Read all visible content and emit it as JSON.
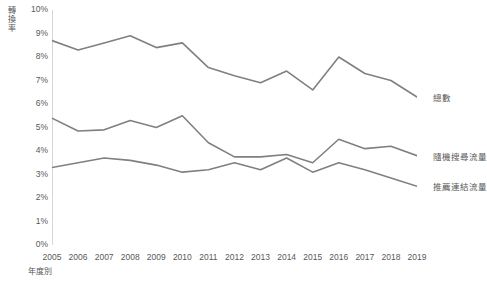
{
  "chart_data": {
    "type": "line",
    "title": "",
    "xlabel": "年度別",
    "ylabel": "轉換率",
    "x": [
      2005,
      2006,
      2007,
      2008,
      2009,
      2010,
      2011,
      2012,
      2013,
      2014,
      2015,
      2016,
      2017,
      2018,
      2019
    ],
    "categories": [
      "2005",
      "2006",
      "2007",
      "2008",
      "2009",
      "2010",
      "2011",
      "2012",
      "2013",
      "2014",
      "2015",
      "2016",
      "2017",
      "2018",
      "2019"
    ],
    "ylim": [
      0,
      10
    ],
    "ytick_labels": [
      "0%",
      "1%",
      "2%",
      "3%",
      "4%",
      "5%",
      "6%",
      "7%",
      "8%",
      "9%",
      "10%"
    ],
    "ytick_values": [
      0,
      1,
      2,
      3,
      4,
      5,
      6,
      7,
      8,
      9,
      10
    ],
    "grid": false,
    "legend_position": "right-of-line-ends",
    "series": [
      {
        "name": "總數",
        "color": "#808080",
        "values": [
          8.7,
          8.3,
          8.6,
          8.9,
          8.4,
          8.6,
          7.55,
          7.2,
          6.9,
          7.4,
          6.6,
          8.0,
          7.3,
          7.0,
          6.3
        ]
      },
      {
        "name": "隨機搜尋流量",
        "color": "#808080",
        "values": [
          5.4,
          4.85,
          4.9,
          5.3,
          5.0,
          5.5,
          4.35,
          3.75,
          3.75,
          3.85,
          3.5,
          4.5,
          4.1,
          4.2,
          3.8
        ]
      },
      {
        "name": "推薦連結流量",
        "color": "#808080",
        "values": [
          3.3,
          3.5,
          3.7,
          3.6,
          3.4,
          3.1,
          3.2,
          3.5,
          3.2,
          3.7,
          3.1,
          3.5,
          3.2,
          2.85,
          2.5
        ]
      }
    ]
  },
  "axes": {
    "y_title": "轉換率",
    "x_title": "年度別"
  },
  "style": {
    "line_color": "#808080",
    "axis_color": "#b0b0b0",
    "text_color": "#595959",
    "background": "#ffffff"
  }
}
